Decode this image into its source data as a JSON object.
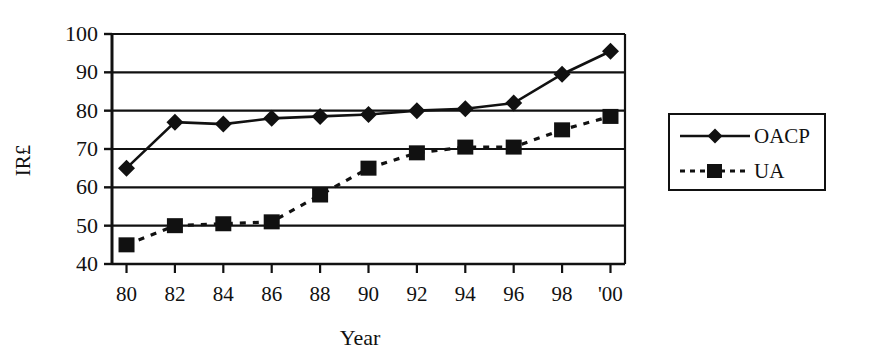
{
  "chart_data": {
    "type": "line",
    "title": "",
    "subtitle": "",
    "xlabel": "Year",
    "ylabel": "IR£",
    "x": [
      80,
      82,
      84,
      86,
      88,
      90,
      92,
      94,
      96,
      98,
      100
    ],
    "categories": [
      "80",
      "82",
      "84",
      "86",
      "88",
      "90",
      "92",
      "94",
      "96",
      "98",
      "'00"
    ],
    "xtick_labels": [
      "80",
      "82",
      "84",
      "86",
      "88",
      "90",
      "92",
      "94",
      "96",
      "98",
      "'00"
    ],
    "ytick_labels": [
      "40",
      "50",
      "60",
      "70",
      "80",
      "90",
      "100"
    ],
    "ytick_values": [
      40,
      50,
      60,
      70,
      80,
      90,
      100
    ],
    "ylim": [
      40,
      100
    ],
    "grid": "horizontal",
    "legend_position": "right-outside",
    "series": [
      {
        "name": "OACP",
        "marker": "diamond",
        "linestyle": "solid",
        "color": "#111111",
        "values": [
          65,
          77,
          76.5,
          78,
          78.5,
          79,
          80,
          80.5,
          82,
          89.5,
          95.5
        ]
      },
      {
        "name": "UA",
        "marker": "square",
        "linestyle": "dashed",
        "color": "#111111",
        "values": [
          45,
          50,
          50.5,
          51,
          58,
          65,
          69,
          70.5,
          70.5,
          75,
          78.5
        ]
      }
    ]
  },
  "legend": {
    "entries": [
      {
        "label": "OACP"
      },
      {
        "label": "UA"
      }
    ]
  }
}
